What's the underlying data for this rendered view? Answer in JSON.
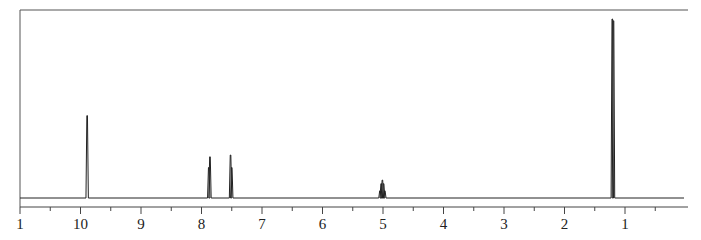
{
  "chart_data": {
    "type": "line",
    "title": "",
    "subtitle": "",
    "xlabel": "",
    "ylabel": "",
    "x_axis": {
      "reversed": true,
      "range": [
        11,
        -0.05
      ],
      "major_ticks": [
        11,
        10,
        9,
        8,
        7,
        6,
        5,
        4,
        3,
        2,
        1
      ],
      "tick_labels": [
        "1",
        "10",
        "9",
        "8",
        "7",
        "6",
        "5",
        "4",
        "3",
        "2",
        "1"
      ],
      "minor_ticks": [
        10.5,
        9.5,
        8.5,
        7.5,
        6.5,
        5.5,
        4.5,
        3.5,
        2.5,
        1.5,
        0.5
      ]
    },
    "grid": false,
    "legend": null,
    "peaks": [
      {
        "shift": 9.89,
        "multiplicity": "s",
        "relative_height": 0.46
      },
      {
        "shift": 7.87,
        "multiplicity": "d",
        "relative_height": 0.23,
        "lines": [
          7.88,
          7.86
        ],
        "heights": [
          0.17,
          0.23
        ]
      },
      {
        "shift": 7.51,
        "multiplicity": "d",
        "relative_height": 0.24,
        "lines": [
          7.52,
          7.5
        ],
        "heights": [
          0.24,
          0.17
        ]
      },
      {
        "shift": 5.01,
        "multiplicity": "m",
        "relative_height": 0.1,
        "lines": [
          5.05,
          5.03,
          5.01,
          4.99,
          4.97
        ],
        "heights": [
          0.04,
          0.08,
          0.1,
          0.08,
          0.04
        ]
      },
      {
        "shift": 1.2,
        "multiplicity": "d",
        "relative_height": 1.0
      }
    ]
  },
  "axis": {
    "labels": [
      "1",
      "10",
      "9",
      "8",
      "7",
      "6",
      "5",
      "4",
      "3",
      "2",
      "1"
    ]
  }
}
